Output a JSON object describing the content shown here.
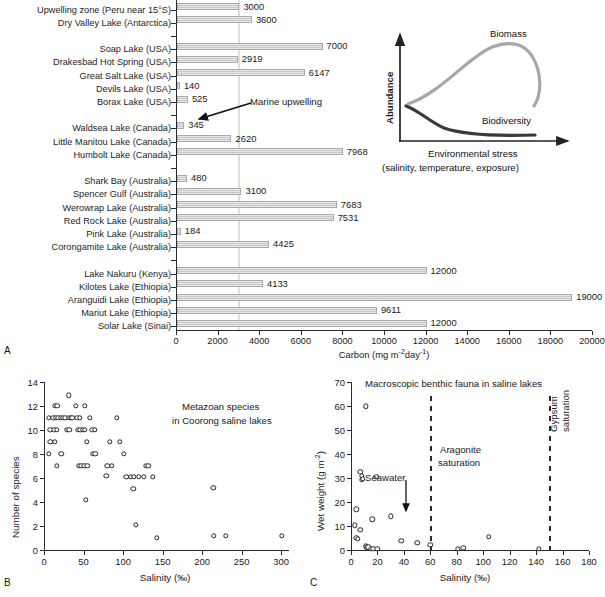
{
  "figure": {
    "panel_a_letter": "A",
    "panel_b_letter": "B",
    "panel_c_letter": "C"
  },
  "chart_data": [
    {
      "type": "bar",
      "panel": "A",
      "title": "",
      "xlabel": "Carbon (mg m-2 day-1)",
      "ylabel": "",
      "xlim": [
        0,
        20000
      ],
      "xticks": [
        0,
        2000,
        4000,
        6000,
        8000,
        10000,
        12000,
        14000,
        16000,
        18000,
        20000
      ],
      "grid": false,
      "orientation": "horizontal",
      "annotation_line": {
        "label": "Marine upwelling",
        "value": 3000
      },
      "categories": [
        "Upwelling zone (Peru near 15°S)",
        "Dry Valley Lake (Antarctica)",
        "",
        "Soap Lake (USA)",
        "Drakesbad Hot Spring (USA)",
        "Great Salt Lake (USA)",
        "Devils Lake (USA)",
        "Borax Lake (USA)",
        "",
        "Waldsea Lake (Canada)",
        "Little Manitou Lake (Canada)",
        "Humbolt Lake (Canada)",
        "",
        "Shark Bay (Australia)",
        "Spencer Gulf (Australia)",
        "Werowrap Lake (Australia)",
        "Red Rock Lake (Australia)",
        "Pink Lake (Australia)",
        "Corongamite Lake (Australia)",
        "",
        "Lake Nakuru (Kenya)",
        "Kilotes Lake (Ethiopia)",
        "Aranguidi Lake (Ethiopia)",
        "Mariut Lake (Ethiopia)",
        "Solar Lake (Sinai)"
      ],
      "values": [
        3000,
        3600,
        null,
        7000,
        2919,
        6147,
        140,
        525,
        null,
        345,
        2620,
        7968,
        null,
        480,
        3100,
        7683,
        7531,
        184,
        4425,
        null,
        12000,
        4133,
        19000,
        9611,
        12000
      ],
      "value_labels": [
        "3000",
        "3600",
        "",
        "7000",
        "2919",
        "6147",
        "140",
        "525",
        "",
        "345",
        "2620",
        "7968",
        "",
        "480",
        "3100",
        "7683",
        "7531",
        "184",
        "4425",
        "",
        "12000",
        "4133",
        "19000",
        "9611",
        "12000"
      ]
    },
    {
      "type": "scatter",
      "panel": "B",
      "title": "Metazoan species\nin Coorong saline lakes",
      "title_line1": "Metazoan species",
      "title_line2": "in Coorong saline lakes",
      "xlabel": "Salinity (‰)",
      "ylabel": "Number of species",
      "xlim": [
        0,
        310
      ],
      "ylim": [
        0,
        14
      ],
      "xticks": [
        0,
        50,
        100,
        150,
        200,
        250,
        300
      ],
      "yticks": [
        0,
        2,
        4,
        6,
        8,
        10,
        12,
        14
      ],
      "points": [
        [
          6,
          11
        ],
        [
          8,
          10
        ],
        [
          8,
          9
        ],
        [
          6,
          8
        ],
        [
          14,
          12
        ],
        [
          17,
          12
        ],
        [
          12,
          11
        ],
        [
          15,
          11
        ],
        [
          18,
          11
        ],
        [
          21,
          11
        ],
        [
          24,
          11
        ],
        [
          27,
          11
        ],
        [
          13,
          10
        ],
        [
          16,
          10
        ],
        [
          14,
          9
        ],
        [
          16,
          7
        ],
        [
          22,
          8
        ],
        [
          31,
          12.9
        ],
        [
          31,
          11
        ],
        [
          34,
          11
        ],
        [
          36,
          11
        ],
        [
          42,
          11
        ],
        [
          45,
          11
        ],
        [
          29,
          10
        ],
        [
          32,
          10
        ],
        [
          40,
          12
        ],
        [
          52,
          12
        ],
        [
          43,
          10
        ],
        [
          46,
          10
        ],
        [
          49,
          10
        ],
        [
          52,
          10
        ],
        [
          44,
          7
        ],
        [
          47,
          7
        ],
        [
          51,
          7
        ],
        [
          55,
          7
        ],
        [
          54,
          9
        ],
        [
          53,
          4.2
        ],
        [
          58,
          11
        ],
        [
          62,
          8
        ],
        [
          65,
          8
        ],
        [
          61,
          10
        ],
        [
          64,
          10
        ],
        [
          80,
          7
        ],
        [
          79,
          6.2
        ],
        [
          86,
          7
        ],
        [
          83,
          9
        ],
        [
          92,
          11
        ],
        [
          96,
          9
        ],
        [
          101,
          8
        ],
        [
          104,
          6.1
        ],
        [
          110,
          6.1
        ],
        [
          114,
          6.1
        ],
        [
          113,
          5.1
        ],
        [
          116,
          2.1
        ],
        [
          120,
          6.1
        ],
        [
          126,
          6.1
        ],
        [
          129,
          7
        ],
        [
          132,
          7
        ],
        [
          138,
          6.1
        ],
        [
          143,
          1
        ],
        [
          214,
          5.2
        ],
        [
          215,
          1.2
        ],
        [
          230,
          1.2
        ],
        [
          301,
          1.2
        ]
      ]
    },
    {
      "type": "scatter",
      "panel": "C",
      "title": "Macroscopic benthic fauna in saline lakes",
      "xlabel": "Salinity (‰)",
      "ylabel": "Wet weight (g m-2)",
      "xlim": [
        0,
        180
      ],
      "ylim": [
        0,
        70
      ],
      "xticks": [
        0,
        20,
        40,
        60,
        80,
        100,
        120,
        140,
        160,
        180
      ],
      "yticks": [
        0,
        10,
        20,
        30,
        40,
        50,
        60,
        70
      ],
      "annotations": [
        {
          "label": "Seawater",
          "type": "arrow",
          "x": 35
        },
        {
          "label": "Aragonite saturation",
          "type": "dashed-line",
          "x": 60
        },
        {
          "label": "Gypsum saturation",
          "type": "dashed-line",
          "x": 150
        }
      ],
      "annotation_aragonite_line1": "Aragonite",
      "annotation_aragonite_line2": "saturation",
      "annotation_gypsum_line1": "Gypsum",
      "annotation_gypsum_line2": "saturation",
      "annotation_seawater": "Seawater",
      "points": [
        [
          11,
          59.8
        ],
        [
          7,
          32.5
        ],
        [
          8,
          31
        ],
        [
          8,
          29.3
        ],
        [
          9,
          29.6
        ],
        [
          19,
          30.5
        ],
        [
          4,
          17
        ],
        [
          3,
          10.3
        ],
        [
          7,
          8.3
        ],
        [
          4,
          5
        ],
        [
          5,
          4.6
        ],
        [
          16,
          12.8
        ],
        [
          30,
          14
        ],
        [
          11,
          1.5
        ],
        [
          12,
          1.2
        ],
        [
          13,
          1.1
        ],
        [
          15,
          0.6
        ],
        [
          17,
          0.6
        ],
        [
          20,
          0.4
        ],
        [
          38,
          3.8
        ],
        [
          50,
          3
        ],
        [
          60,
          2.2
        ],
        [
          81,
          0.5
        ],
        [
          85,
          1
        ],
        [
          104,
          5.5
        ],
        [
          142,
          0.4
        ]
      ]
    }
  ],
  "panel_a": {
    "xlabel_main": "Carbon (mg m",
    "xlabel_sup1": "-2",
    "xlabel_mid": "day",
    "xlabel_sup2": "-1",
    "xlabel_end": ")",
    "upwelling_label": "Marine upwelling"
  },
  "inset": {
    "ylabel": "Abundance",
    "xlabel_line1": "Environmental stress",
    "xlabel_line2": "(salinity, temperature, exposure)",
    "curve_biomass_label": "Biomass",
    "curve_biodiversity_label": "Biodiversity",
    "biomass_color": "#a8a8a8",
    "biodiversity_color": "#3a3a3a"
  },
  "panel_b": {
    "ylabel": "Number of species",
    "xlabel": "Salinity (‰)",
    "note_line1": "Metazoan species",
    "note_line2": "in Coorong saline lakes"
  },
  "panel_c": {
    "ylabel_main": "Wet weight (g m",
    "ylabel_sup": "-2",
    "ylabel_end": ")",
    "xlabel": "Salinity (‰)",
    "title": "Macroscopic benthic fauna in saline lakes",
    "seawater": "Seawater",
    "aragonite_1": "Aragonite",
    "aragonite_2": "saturation",
    "gypsum_1": "Gypsum",
    "gypsum_2": "saturation"
  },
  "colors": {
    "bar_fill": "#c9c9c9",
    "axis": "#2b2b2b",
    "gridline": "#dedede"
  }
}
